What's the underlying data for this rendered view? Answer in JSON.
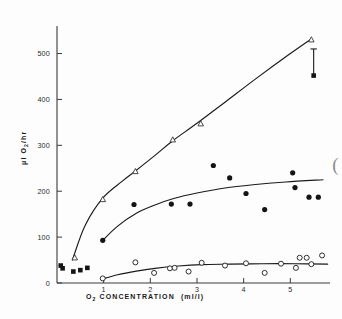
{
  "chart_data": {
    "type": "scatter",
    "title": "",
    "xlabel": "O2 CONCENTRATION (ml/l)",
    "xlabel_main": "O",
    "xlabel_sub": "2",
    "xlabel_rest": "CONCENTRATION",
    "xlabel_units": "(ml/l)",
    "ylabel": "μl O2/hr",
    "ylabel_pre": "μl O",
    "ylabel_sub": "2",
    "ylabel_post": "/hr",
    "xlim": [
      0,
      5.85
    ],
    "ylim": [
      0,
      560
    ],
    "xticks": [
      1,
      2,
      3,
      4,
      5
    ],
    "xtick_labels": [
      "1",
      "2",
      "3",
      "4",
      "5"
    ],
    "yticks": [
      0,
      100,
      200,
      300,
      400,
      500
    ],
    "ytick_labels": [
      "0",
      "100",
      "200",
      "300",
      "400",
      "500"
    ],
    "grid": false,
    "legend_position": "none",
    "series": [
      {
        "name": "upper-series-open-triangles",
        "marker": "open-triangle",
        "color": "#2a2a2a",
        "points": [
          {
            "x": 0.38,
            "y": 55
          },
          {
            "x": 0.98,
            "y": 182
          },
          {
            "x": 1.68,
            "y": 243
          },
          {
            "x": 2.48,
            "y": 312
          },
          {
            "x": 3.08,
            "y": 347
          },
          {
            "x": 5.45,
            "y": 530
          }
        ],
        "fit_curve": [
          {
            "x": 0.33,
            "y": 50
          },
          {
            "x": 0.6,
            "y": 125
          },
          {
            "x": 0.98,
            "y": 185
          },
          {
            "x": 1.4,
            "y": 222
          },
          {
            "x": 1.68,
            "y": 244
          },
          {
            "x": 2.1,
            "y": 278
          },
          {
            "x": 2.48,
            "y": 310
          },
          {
            "x": 3.0,
            "y": 348
          },
          {
            "x": 3.6,
            "y": 394
          },
          {
            "x": 4.3,
            "y": 448
          },
          {
            "x": 5.0,
            "y": 500
          },
          {
            "x": 5.45,
            "y": 532
          }
        ]
      },
      {
        "name": "middle-series-filled-circles",
        "marker": "filled-circle",
        "color": "#141414",
        "points": [
          {
            "x": 0.98,
            "y": 93
          },
          {
            "x": 1.65,
            "y": 171
          },
          {
            "x": 2.45,
            "y": 172
          },
          {
            "x": 2.85,
            "y": 172
          },
          {
            "x": 3.35,
            "y": 256
          },
          {
            "x": 3.7,
            "y": 229
          },
          {
            "x": 4.05,
            "y": 195
          },
          {
            "x": 4.45,
            "y": 160
          },
          {
            "x": 5.05,
            "y": 240
          },
          {
            "x": 5.1,
            "y": 208
          },
          {
            "x": 5.4,
            "y": 187
          },
          {
            "x": 5.6,
            "y": 187
          }
        ],
        "fit_curve": [
          {
            "x": 0.98,
            "y": 93
          },
          {
            "x": 1.3,
            "y": 124
          },
          {
            "x": 1.7,
            "y": 152
          },
          {
            "x": 2.1,
            "y": 170
          },
          {
            "x": 2.5,
            "y": 184
          },
          {
            "x": 3.0,
            "y": 196
          },
          {
            "x": 3.6,
            "y": 207
          },
          {
            "x": 4.2,
            "y": 214
          },
          {
            "x": 4.9,
            "y": 220
          },
          {
            "x": 5.7,
            "y": 225
          }
        ]
      },
      {
        "name": "lower-series-open-circles",
        "marker": "open-circle",
        "color": "#1a1a1a",
        "points": [
          {
            "x": 0.98,
            "y": 10
          },
          {
            "x": 1.68,
            "y": 45
          },
          {
            "x": 2.08,
            "y": 22
          },
          {
            "x": 2.42,
            "y": 32
          },
          {
            "x": 2.52,
            "y": 33
          },
          {
            "x": 2.82,
            "y": 25
          },
          {
            "x": 3.1,
            "y": 44
          },
          {
            "x": 3.6,
            "y": 38
          },
          {
            "x": 4.05,
            "y": 43
          },
          {
            "x": 4.45,
            "y": 22
          },
          {
            "x": 4.8,
            "y": 42
          },
          {
            "x": 5.12,
            "y": 33
          },
          {
            "x": 5.2,
            "y": 55
          },
          {
            "x": 5.35,
            "y": 55
          },
          {
            "x": 5.45,
            "y": 41
          },
          {
            "x": 5.68,
            "y": 60
          }
        ],
        "fit_curve": [
          {
            "x": 0.95,
            "y": 8
          },
          {
            "x": 1.3,
            "y": 18
          },
          {
            "x": 1.7,
            "y": 26
          },
          {
            "x": 2.1,
            "y": 32
          },
          {
            "x": 2.6,
            "y": 37
          },
          {
            "x": 3.1,
            "y": 40
          },
          {
            "x": 3.7,
            "y": 41
          },
          {
            "x": 4.4,
            "y": 42
          },
          {
            "x": 5.1,
            "y": 42
          },
          {
            "x": 5.8,
            "y": 41
          }
        ]
      },
      {
        "name": "origin-series-filled-squares",
        "marker": "filled-square",
        "color": "#141414",
        "points": [
          {
            "x": 0.08,
            "y": 38
          },
          {
            "x": 0.12,
            "y": 32
          },
          {
            "x": 0.35,
            "y": 25
          },
          {
            "x": 0.5,
            "y": 28
          },
          {
            "x": 0.65,
            "y": 33
          }
        ]
      }
    ],
    "annotations": [
      {
        "name": "error-bar",
        "type": "errorbar",
        "x": 5.5,
        "y": 452,
        "y_upper": 510,
        "marker": "filled-square"
      },
      {
        "name": "edge-paren-artifact",
        "type": "text",
        "text": "(",
        "x": 5.9,
        "y": 245
      }
    ]
  }
}
